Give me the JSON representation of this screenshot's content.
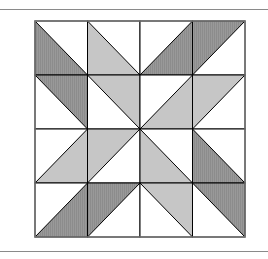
{
  "figure": {
    "title": "",
    "grid": {
      "rows": 4,
      "cols": 4,
      "x": 35,
      "y": 21,
      "width": 210,
      "height": 216
    },
    "colors": {
      "dark": "#8c8c8c",
      "light": "#c6c6c6",
      "white": "#ffffff",
      "stroke": "#000000",
      "frame": "#777777",
      "rule": "#8a8a8a"
    },
    "cells": [
      [
        {
          "diag": "TLBR",
          "shaded": "lower-left",
          "tone": "dark"
        },
        {
          "diag": "TLBR",
          "shaded": "lower-left",
          "tone": "light"
        },
        {
          "diag": "TRBL",
          "shaded": "lower-right",
          "tone": "dark"
        },
        {
          "diag": "TRBL",
          "shaded": "upper-left",
          "tone": "dark"
        }
      ],
      [
        {
          "diag": "TLBR",
          "shaded": "upper-right",
          "tone": "dark"
        },
        {
          "diag": "TLBR",
          "shaded": "upper-right",
          "tone": "light"
        },
        {
          "diag": "TRBL",
          "shaded": "lower-right",
          "tone": "light"
        },
        {
          "diag": "TRBL",
          "shaded": "upper-left",
          "tone": "light"
        }
      ],
      [
        {
          "diag": "TRBL",
          "shaded": "lower-right",
          "tone": "light"
        },
        {
          "diag": "TRBL",
          "shaded": "upper-left",
          "tone": "light"
        },
        {
          "diag": "TLBR",
          "shaded": "lower-left",
          "tone": "light"
        },
        {
          "diag": "TLBR",
          "shaded": "lower-left",
          "tone": "dark"
        }
      ],
      [
        {
          "diag": "TRBL",
          "shaded": "lower-right",
          "tone": "dark"
        },
        {
          "diag": "TRBL",
          "shaded": "upper-left",
          "tone": "dark"
        },
        {
          "diag": "TLBR",
          "shaded": "upper-right",
          "tone": "light"
        },
        {
          "diag": "TLBR",
          "shaded": "upper-right",
          "tone": "dark"
        }
      ]
    ]
  }
}
